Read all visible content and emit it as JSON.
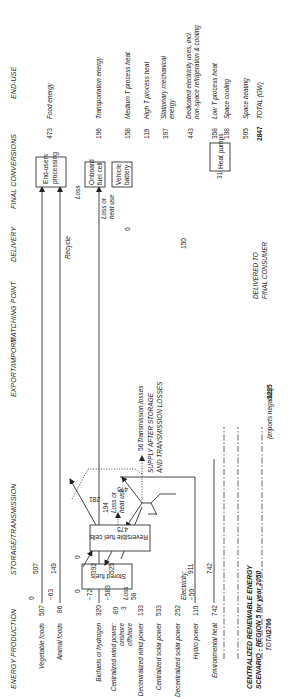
{
  "title": {
    "line1": "CENTRALIZED RENEWABLE ENERGY",
    "line2": "SCENARIO - REGION 5 for year 2050",
    "total_label": "TOTAL",
    "total_value": "2766"
  },
  "headers": {
    "production": "ENERGY PRODUCTION",
    "storage": "STORAGE/TRANSMISSION",
    "export": "EXPORT/IMPORT",
    "matching": "MATCHING POINT",
    "delivery": "DELIVERY",
    "final": "FINAL CONVERSIONS",
    "enduse": "END-USE"
  },
  "production": [
    {
      "label": "Vegetable foods",
      "value": "507"
    },
    {
      "label": "Animal foods",
      "value": "86"
    },
    {
      "label": "Biofuels or hydrogen",
      "value": "320"
    },
    {
      "label": "Centralized wind power:",
      "sub1": "onshore",
      "sub2": "offshore",
      "value": "80",
      "value2": "3"
    },
    {
      "label": "Decentralized wind power",
      "value": "133"
    },
    {
      "label": "Centralized solar power",
      "value": "533"
    },
    {
      "label": "Decentralized solar power",
      "value": "252"
    },
    {
      "label": "Hydro power",
      "value": "110"
    },
    {
      "label": "Environmental heat",
      "value": "742"
    }
  ],
  "export_import": {
    "values": [
      "0",
      "−63",
      "−72",
      "−583",
      "−50"
    ],
    "electricity_label": "Electricity:",
    "loss_label": "Loss",
    "loss_value": "58",
    "note": "(imports negative)",
    "supply_total": "3225"
  },
  "matching": {
    "values": [
      "507",
      "149",
      "392",
      "525",
      "911",
      "742"
    ]
  },
  "storage": {
    "stored_fuels": "Stored fuels",
    "rev_fuel_cells": "Reversible fuel cells",
    "stored_in": "0",
    "stored_out": "0",
    "to_cells": "475",
    "to_grid": "475",
    "cells_out": "281",
    "cells_loss": "194",
    "loss_or_heat": [
      "Loss or",
      "heat use"
    ],
    "transmission_value": "56",
    "transmission_label": "Transmission losses",
    "supply_line1": "SUPPLY AFTER STORAGE",
    "supply_line2": "AND TRANSMISSION LOSSES"
  },
  "delivery": {
    "recycle": "Recycle",
    "loss": "Loss",
    "loss_or_heat": [
      "Loss or",
      "heat use"
    ],
    "zero": "0",
    "v150": "150",
    "v318": "318",
    "delivered1": "DELIVERED TO",
    "delivered2": "FINAL CONSUMER"
  },
  "final_conversions": {
    "end_users": [
      "End-users",
      "processing"
    ],
    "onboard": [
      "Onboard",
      "fuel cell"
    ],
    "vehicle": [
      "Vehicle",
      "battery"
    ],
    "heat_pumps": "Heat pumps"
  },
  "enduse": [
    {
      "value": "473",
      "label": "Food energy"
    },
    {
      "value": "196",
      "label": "Transportation energy"
    },
    {
      "value": "158",
      "label": "Medium T process heat"
    },
    {
      "value": "119",
      "label": "High T process heat"
    },
    {
      "value": "397",
      "label": "Stationary mechanical",
      "label2": "energy"
    },
    {
      "value": "443",
      "label": "Dedicated electricity uses, incl.",
      "label2": "non-space refrigeration & cooling"
    },
    {
      "value": "358",
      "label": "Low T process heat"
    },
    {
      "value": "198",
      "label": "Space cooling"
    },
    {
      "value": "505",
      "label": "Space heating"
    },
    {
      "value": "2847",
      "label": "TOTAL (GW)"
    }
  ]
}
